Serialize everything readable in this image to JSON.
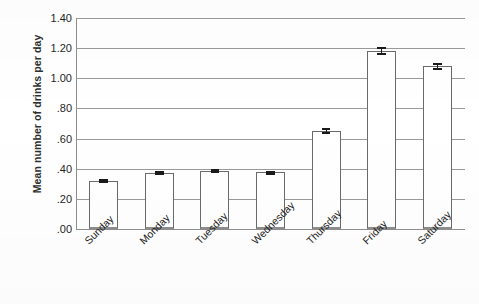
{
  "chart_data": {
    "type": "bar",
    "title": "",
    "xlabel": "",
    "ylabel": "Mean number of drinks per day",
    "categories": [
      "Sunday",
      "Monday",
      "Tuesday",
      "Wednesday",
      "Thursday",
      "Friday",
      "Saturday"
    ],
    "values": [
      0.32,
      0.37,
      0.385,
      0.375,
      0.65,
      1.18,
      1.08
    ],
    "errors": [
      0.015,
      0.013,
      0.013,
      0.013,
      0.018,
      0.025,
      0.022
    ],
    "ylim": [
      0.0,
      1.4
    ],
    "ytick_values": [
      1.4,
      1.2,
      1.0,
      0.8,
      0.6,
      0.4,
      0.2,
      0.0
    ],
    "ytick_labels": [
      "1.40",
      "1.20",
      "1.00",
      ".80",
      ".60",
      ".40",
      ".20",
      ".00"
    ],
    "grid": true,
    "legend": false,
    "legend_position": "none",
    "error_bar_style": "I-beam caps",
    "bar_fill_color": "#ffffff",
    "bar_edge_color": "#6a6a6a",
    "gridline_color": "#9a9a9a",
    "error_bar_color": "#1a1a1a",
    "x_label_rotation_degrees": -45
  }
}
